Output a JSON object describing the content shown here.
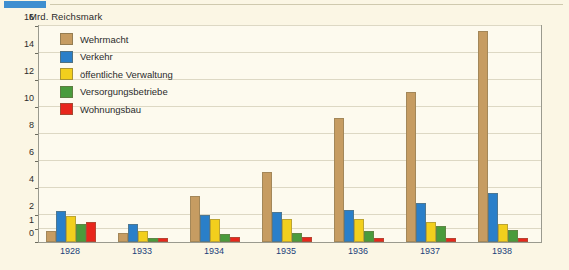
{
  "top_marker": {
    "name": "page-marker",
    "color": "#3f8fd0"
  },
  "axis_unit_label": "Mrd. Reichsmark",
  "legend": {
    "items": [
      {
        "label": "Wehrmacht",
        "color": "#c69c62"
      },
      {
        "label": "Verkehr",
        "color": "#2a7fc9"
      },
      {
        "label": "öffentliche Verwaltung",
        "color": "#f2cf1d"
      },
      {
        "label": "Versorgungsbetriebe",
        "color": "#4a9b3c"
      },
      {
        "label": "Wohnungsbau",
        "color": "#e8261c"
      }
    ]
  },
  "colors": {
    "background": "#fbf6e4",
    "plot_background": "#fdfaee",
    "frame": "#9a9a8e",
    "gridline": "#ddd8c4",
    "tick_text": "#2b2b2b",
    "x_label": "#1b3f7a"
  },
  "chart_data": {
    "type": "bar",
    "title": "",
    "subtitle": "",
    "xlabel": "",
    "ylabel": "Mrd. Reichsmark",
    "ylim": [
      0,
      16
    ],
    "yticks": [
      0,
      1,
      2,
      4,
      6,
      8,
      10,
      12,
      14,
      16
    ],
    "grid": true,
    "legend_position": "inside-top-left",
    "categories": [
      "1928",
      "1933",
      "1934",
      "1935",
      "1936",
      "1937",
      "1938"
    ],
    "series": [
      {
        "name": "Wehrmacht",
        "color": "#c69c62",
        "values": [
          0.8,
          0.7,
          3.4,
          5.2,
          9.2,
          11.1,
          15.6
        ]
      },
      {
        "name": "Verkehr",
        "color": "#2a7fc9",
        "values": [
          2.3,
          1.3,
          2.0,
          2.2,
          2.4,
          2.9,
          3.6
        ]
      },
      {
        "name": "öffentliche Verwaltung",
        "color": "#f2cf1d",
        "values": [
          1.9,
          0.8,
          1.7,
          1.7,
          1.7,
          1.5,
          1.3
        ]
      },
      {
        "name": "Versorgungsbetriebe",
        "color": "#4a9b3c",
        "values": [
          1.3,
          0.3,
          0.6,
          0.7,
          0.8,
          1.2,
          0.9
        ]
      },
      {
        "name": "Wohnungsbau",
        "color": "#e8261c",
        "values": [
          1.5,
          0.3,
          0.4,
          0.4,
          0.3,
          0.3,
          0.3
        ]
      }
    ]
  }
}
